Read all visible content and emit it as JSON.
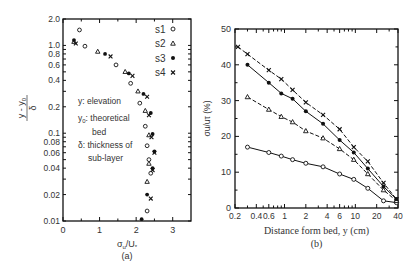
{
  "chart_data": [
    {
      "panel": "(a)",
      "type": "scatter",
      "xlabel": "σu/U*",
      "ylabel": "(y - y0)/δ",
      "xlim": [
        0,
        3.5
      ],
      "ylim": [
        0.01,
        2.0
      ],
      "yscale": "log",
      "xticks": [
        "0",
        "1",
        "2",
        "3"
      ],
      "yticks": [
        "2.0",
        "1.0",
        "0.8",
        "0.6",
        "0.4",
        "0.2",
        "0.1",
        "0.08",
        "0.06",
        "0.04",
        "0.02",
        "0.01"
      ],
      "legend": [
        {
          "name": "s1",
          "marker": "open-circle"
        },
        {
          "name": "s2",
          "marker": "open-triangle"
        },
        {
          "name": "s3",
          "marker": "filled-circle"
        },
        {
          "name": "s4",
          "marker": "cross"
        }
      ],
      "legend_position": "upper right",
      "annotation": [
        "y: elevation",
        "y0: theoretical",
        "bed",
        "δ: thickness of",
        "sub-layer"
      ],
      "series": [
        {
          "name": "s1",
          "points": [
            [
              0.45,
              1.5
            ],
            [
              0.6,
              0.98
            ],
            [
              1.45,
              0.6
            ],
            [
              1.85,
              0.37
            ],
            [
              2.1,
              0.22
            ],
            [
              2.25,
              0.12
            ],
            [
              2.3,
              0.072
            ],
            [
              2.35,
              0.05
            ],
            [
              2.4,
              0.035
            ],
            [
              2.3,
              0.013
            ]
          ]
        },
        {
          "name": "s2",
          "points": [
            [
              0.3,
              1.1
            ],
            [
              0.95,
              0.85
            ],
            [
              1.7,
              0.5
            ],
            [
              2.05,
              0.3
            ],
            [
              2.25,
              0.18
            ],
            [
              2.35,
              0.095
            ],
            [
              2.35,
              0.045
            ],
            [
              2.3,
              0.028
            ]
          ]
        },
        {
          "name": "s3",
          "points": [
            [
              0.3,
              1.15
            ],
            [
              1.15,
              0.8
            ],
            [
              1.8,
              0.48
            ],
            [
              2.2,
              0.28
            ],
            [
              2.4,
              0.17
            ],
            [
              2.45,
              0.098
            ],
            [
              2.5,
              0.062
            ],
            [
              2.45,
              0.04
            ],
            [
              2.3,
              0.02
            ],
            [
              2.15,
              0.0105
            ]
          ]
        },
        {
          "name": "s4",
          "points": [
            [
              0.35,
              1.05
            ],
            [
              1.3,
              0.75
            ],
            [
              1.9,
              0.45
            ],
            [
              2.3,
              0.26
            ],
            [
              2.35,
              0.16
            ],
            [
              2.42,
              0.09
            ],
            [
              2.5,
              0.06
            ],
            [
              2.45,
              0.038
            ],
            [
              2.4,
              0.018
            ]
          ]
        }
      ]
    },
    {
      "panel": "(b)",
      "type": "line",
      "xlabel": "Distance form bed, y (cm)",
      "ylabel": "σu/u* (%)",
      "xlim": [
        0.2,
        40
      ],
      "xscale": "log",
      "ylim": [
        0,
        50
      ],
      "xticks": [
        "0.2",
        "0.4",
        "0.6",
        "1",
        "2",
        "4",
        "6",
        "10",
        "20",
        "40"
      ],
      "yticks": [
        "0",
        "10",
        "20",
        "30",
        "40",
        "50"
      ],
      "series": [
        {
          "name": "s1",
          "marker": "open-circle",
          "line": "solid",
          "x": [
            0.3,
            0.6,
            0.9,
            1.3,
            2,
            3.5,
            6,
            9.5,
            15,
            25,
            38
          ],
          "y": [
            17,
            15.5,
            14.5,
            13.5,
            12.5,
            11.5,
            9.5,
            8,
            5.5,
            2,
            1.5
          ]
        },
        {
          "name": "s2",
          "marker": "open-triangle",
          "line": "dashed",
          "x": [
            0.3,
            0.6,
            0.9,
            1.3,
            2,
            3.5,
            6,
            9.5,
            15,
            25,
            38
          ],
          "y": [
            31,
            27.5,
            25.5,
            24,
            21.5,
            19.5,
            16.5,
            13.5,
            9.5,
            5,
            2
          ]
        },
        {
          "name": "s3",
          "marker": "filled-circle",
          "line": "solid",
          "x": [
            0.3,
            0.6,
            0.9,
            1.3,
            2,
            3.5,
            6,
            9.5,
            15,
            25,
            38
          ],
          "y": [
            40,
            35,
            32,
            30.5,
            27,
            23.5,
            19,
            15.5,
            11,
            6,
            2.5
          ]
        },
        {
          "name": "s4",
          "marker": "cross",
          "line": "dashed",
          "x": [
            0.22,
            0.3,
            0.6,
            0.9,
            1.3,
            2,
            3.5,
            6,
            9.5,
            15,
            25,
            38
          ],
          "y": [
            45,
            43,
            38.5,
            36,
            33,
            29.5,
            26,
            22,
            17,
            13,
            7,
            2.5
          ]
        }
      ]
    }
  ],
  "panels": {
    "a": {
      "caption": "(a)",
      "xlabel_main": "σ",
      "xlabel_sub": "u",
      "xlabel_rest": "/U",
      "xlabel_star": "*",
      "ylabel_num": "y - y",
      "ylabel_num_sub": "0",
      "ylabel_den": "δ"
    },
    "b": {
      "caption": "(b)",
      "xlabel": "Distance form bed, y (cm)",
      "ylabel": "σu/uτ (%)"
    }
  }
}
